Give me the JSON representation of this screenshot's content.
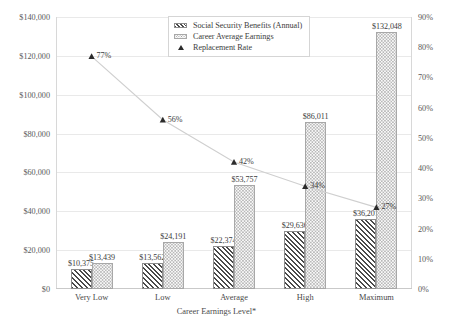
{
  "chart_data": {
    "type": "bar",
    "title": "",
    "subtitle": "",
    "xlabel": "Career Earnings Level*",
    "ylabel": "",
    "y2label": "",
    "categories": [
      "Very Low",
      "Low",
      "Average",
      "High",
      "Maximum"
    ],
    "ylim": [
      0,
      140000
    ],
    "y2lim": [
      0,
      0.9
    ],
    "grid": true,
    "legend_position": "top-center",
    "yticks": [
      "$0",
      "$20,000",
      "$40,000",
      "$60,000",
      "$80,000",
      "$100,000",
      "$120,000",
      "$140,000"
    ],
    "ytick_values": [
      0,
      20000,
      40000,
      60000,
      80000,
      100000,
      120000,
      140000
    ],
    "y2ticks": [
      "0%",
      "10%",
      "20%",
      "30%",
      "40%",
      "50%",
      "60%",
      "70%",
      "80%",
      "90%"
    ],
    "y2tick_values": [
      0,
      10,
      20,
      30,
      40,
      50,
      60,
      70,
      80,
      90
    ],
    "series": [
      {
        "name": "Social Security Benefits (Annual)",
        "kind": "bar",
        "axis": "left",
        "pattern": "diagonal-hatch",
        "values": [
          10375,
          13562,
          22374,
          29636,
          36201
        ],
        "labels": [
          "$10,375",
          "$13,562",
          "$22,374",
          "$29,636",
          "$36,201"
        ]
      },
      {
        "name": "Career Average Earnings",
        "kind": "bar",
        "axis": "left",
        "pattern": "dotted",
        "values": [
          13439,
          24191,
          53757,
          86011,
          132048
        ],
        "labels": [
          "$13,439",
          "$24,191",
          "$53,757",
          "$86,011",
          "$132,048"
        ]
      },
      {
        "name": "Replacement Rate",
        "kind": "line-marker",
        "axis": "right",
        "marker": "triangle",
        "values": [
          77,
          56,
          42,
          34,
          27
        ],
        "labels": [
          "77%",
          "56%",
          "42%",
          "34%",
          "27%"
        ]
      }
    ]
  },
  "legend": {
    "items": [
      {
        "label": "Social Security Benefits (Annual)"
      },
      {
        "label": "Career Average Earnings"
      },
      {
        "label": "Replacement Rate"
      }
    ]
  },
  "colors": {
    "hatch": "#4a4a4a",
    "dots": "#a0a0a0",
    "line": "#cfcfcf",
    "marker": "#2b2b2b",
    "grid": "#e9e9e9",
    "text": "#3d3d3d"
  }
}
